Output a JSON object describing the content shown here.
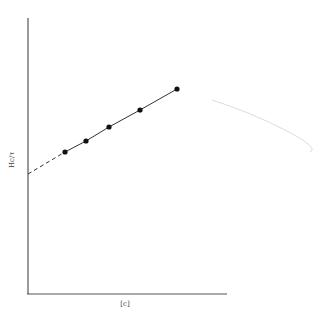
{
  "chart_data": {
    "type": "line",
    "title": "",
    "xlabel": "[c]",
    "ylabel": "Hc/τ",
    "grid": false,
    "legend": null,
    "axes": {
      "x_tick_labels": [],
      "y_tick_labels": []
    },
    "series": [
      {
        "name": "measured",
        "style": "solid line with filled circle markers",
        "points_px": [
          [
            65,
            152
          ],
          [
            86,
            141
          ],
          [
            109,
            127
          ],
          [
            140,
            110
          ],
          [
            177,
            89
          ]
        ],
        "x": [
          0.19,
          0.29,
          0.41,
          0.56,
          0.75
        ],
        "y": [
          0.51,
          0.55,
          0.6,
          0.67,
          0.74
        ]
      },
      {
        "name": "extrapolation",
        "style": "dashed line to y-intercept",
        "points_px": [
          [
            28,
            174
          ],
          [
            65,
            152
          ]
        ],
        "x": [
          0.0,
          0.19
        ],
        "y": [
          0.43,
          0.51
        ]
      },
      {
        "name": "curvature",
        "style": "faint light-gray curve",
        "points_px": [
          [
            212,
            100
          ],
          [
            250,
            112
          ],
          [
            285,
            130
          ],
          [
            310,
            152
          ]
        ]
      }
    ],
    "axis_px": {
      "origin": [
        28,
        294
      ],
      "y_top": 18,
      "x_right": 227
    }
  },
  "labels": {
    "x": "[c]",
    "y": "Hc/τ"
  },
  "colors": {
    "line": "#333333",
    "marker": "#111111",
    "axis": "#555555",
    "faint_curve": "#d8d8d8"
  }
}
